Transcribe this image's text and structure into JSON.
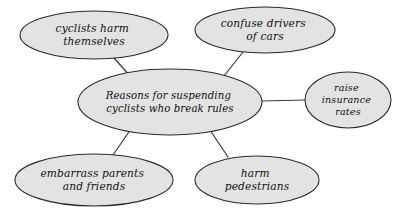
{
  "diagram": {
    "type": "mind-map",
    "title_node": {
      "id": "central",
      "lines": [
        "Reasons for suspending",
        "cyclists who break rules"
      ],
      "cx": 170,
      "cy": 102,
      "rx": 92,
      "ry": 33
    },
    "background_color": "#ffffff",
    "node_fill_color": "#e3e3e3",
    "node_stroke_color": "#2b2b2b",
    "connector_color": "#3a3a3a",
    "text_color": "#111111",
    "nodes": [
      {
        "id": "cyclists-harm-themselves",
        "lines": [
          "cyclists harm",
          "themselves"
        ],
        "cx": 94,
        "cy": 35,
        "rx": 74,
        "ry": 24
      },
      {
        "id": "confuse-drivers-of-cars",
        "lines": [
          "confuse drivers",
          "of cars"
        ],
        "cx": 265,
        "cy": 30,
        "rx": 70,
        "ry": 23
      },
      {
        "id": "raise-insurance-rates",
        "lines": [
          "raise",
          "insurance",
          "rates"
        ],
        "cx": 348,
        "cy": 100,
        "rx": 43,
        "ry": 28
      },
      {
        "id": "embarrass-parents-and-friends",
        "lines": [
          "embarrass parents",
          "and friends"
        ],
        "cx": 94,
        "cy": 180,
        "rx": 79,
        "ry": 26
      },
      {
        "id": "harm-pedestrians",
        "lines": [
          "harm",
          "pedestrians"
        ],
        "cx": 257,
        "cy": 180,
        "rx": 62,
        "ry": 24
      }
    ],
    "connectors": [
      {
        "id": "central-to-cyclists-harm-themselves",
        "x1": 131,
        "y1": 77,
        "x2": 114,
        "y2": 58
      },
      {
        "id": "central-to-confuse-drivers-of-cars",
        "x1": 224,
        "y1": 76,
        "x2": 243,
        "y2": 52
      },
      {
        "id": "central-to-raise-insurance-rates",
        "x1": 262,
        "y1": 101,
        "x2": 306,
        "y2": 100
      },
      {
        "id": "central-to-embarrass-parents-and-friends",
        "x1": 131,
        "y1": 129,
        "x2": 113,
        "y2": 155
      },
      {
        "id": "central-to-harm-pedestrians",
        "x1": 210,
        "y1": 130,
        "x2": 228,
        "y2": 157
      }
    ]
  }
}
